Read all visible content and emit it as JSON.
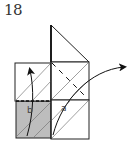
{
  "step": {
    "number": "18"
  },
  "diagram": {
    "labels": [
      {
        "id": "b",
        "text": "b"
      },
      {
        "id": "a",
        "text": "a"
      }
    ],
    "colors": {
      "line": "#222222",
      "thin_line": "#777777",
      "shaded_face": "#bdbdbd",
      "arrow": "#111111"
    }
  }
}
